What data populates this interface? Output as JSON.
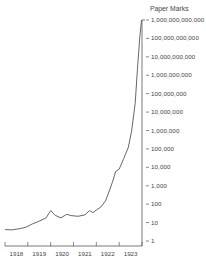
{
  "chart_data": {
    "type": "line",
    "title": "",
    "ylabel": "Paper Marks",
    "xlabel": "",
    "yscale": "log",
    "ylim": [
      1,
      1000000000000
    ],
    "grid": false,
    "legend": null,
    "x_tick_labels": [
      "1918",
      "1919",
      "1920",
      "1921",
      "1922",
      "1923"
    ],
    "y_tick_labels": [
      "1,000,000,000,000",
      "100,000,000,000",
      "10,000,000,000",
      "1,000,000,000",
      "100,000,000",
      "10,000,000",
      "1,000,000",
      "100,000",
      "10,000",
      "1,000",
      "100",
      "10",
      "1"
    ],
    "series": [
      {
        "name": "Paper marks",
        "x": [
          1918.0,
          1918.3,
          1918.6,
          1918.9,
          1919.2,
          1919.5,
          1919.8,
          1920.0,
          1920.2,
          1920.45,
          1920.7,
          1920.9,
          1921.2,
          1921.5,
          1921.7,
          1921.85,
          1922.0,
          1922.2,
          1922.4,
          1922.55,
          1922.7,
          1922.85,
          1923.0,
          1923.2,
          1923.4,
          1923.55,
          1923.7,
          1923.8,
          1923.9,
          1924.0
        ],
        "values": [
          4.2,
          4.0,
          4.6,
          5.5,
          8.5,
          12,
          18,
          45,
          25,
          18,
          28,
          24,
          22,
          26,
          45,
          35,
          48,
          70,
          150,
          450,
          1500,
          6000,
          8000,
          30000,
          120000,
          1000000,
          30000000,
          2000000000,
          100000000000,
          1000000000000
        ]
      }
    ]
  },
  "labels": {
    "axis_title": "Paper Marks",
    "y_ticks": [
      "1,000,000,000,000",
      "100,000,000,000",
      "10,000,000,000",
      "1,000,000,000",
      "100,000,000",
      "10,000,000",
      "1,000,000",
      "100,000",
      "10,000",
      "1,000",
      "100",
      "10",
      "1"
    ],
    "x_ticks": [
      "1918",
      "1919",
      "1920",
      "1921",
      "1922",
      "1923"
    ]
  },
  "colors": {
    "line": "#555555",
    "axis": "#555555",
    "text": "#444444"
  }
}
